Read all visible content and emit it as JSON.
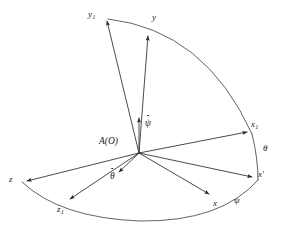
{
  "figure": {
    "type": "technical-line-diagram",
    "background_color": "#ffffff",
    "line_color": "#2b2b2b",
    "origin_label": "A(O)"
  },
  "labels": {
    "origin": "A(O)",
    "y1_base": "y",
    "y1_sub": "1",
    "y": "y",
    "psi_dot": "ψ",
    "x1_base": "x",
    "x1_sub": "1",
    "theta": "θ",
    "x_prime_base": "x",
    "x_prime_mark": "′",
    "psi": "ψ",
    "x": "x",
    "theta_dot": "θ",
    "z": "z",
    "z1_base": "z",
    "z1_sub": "1"
  },
  "axes": [
    {
      "name": "y1",
      "label": "y₁",
      "from": [
        139,
        153
      ],
      "to": [
        106,
        17
      ],
      "arrow": true
    },
    {
      "name": "y",
      "label": "y",
      "from": [
        139,
        153
      ],
      "to": [
        148,
        32
      ],
      "arrow": true
    },
    {
      "name": "psi-dot",
      "label": "ψ̇",
      "from": [
        139,
        153
      ],
      "to": [
        139,
        115
      ],
      "arrow": true
    },
    {
      "name": "x1",
      "label": "x₁",
      "from": [
        139,
        153
      ],
      "to": [
        250,
        131
      ],
      "arrow": true
    },
    {
      "name": "x-prime",
      "label": "x′",
      "from": [
        139,
        153
      ],
      "to": [
        256,
        178
      ],
      "arrow": true
    },
    {
      "name": "x",
      "label": "x",
      "from": [
        139,
        153
      ],
      "to": [
        213,
        196
      ],
      "arrow": true
    },
    {
      "name": "theta-dot",
      "label": "θ̇",
      "from": [
        139,
        153
      ],
      "to": [
        116,
        175
      ],
      "arrow": true
    },
    {
      "name": "z1",
      "label": "z₁",
      "from": [
        139,
        153
      ],
      "to": [
        66,
        202
      ],
      "arrow": true
    },
    {
      "name": "z",
      "label": "z",
      "from": [
        139,
        153
      ],
      "to": [
        22,
        181
      ],
      "arrow": true
    }
  ],
  "arcs": [
    {
      "name": "arc-y1-to-x1",
      "from": [
        106,
        17
      ],
      "to": [
        253,
        135
      ],
      "note": "passes through y"
    },
    {
      "name": "arc-x1-to-xprime",
      "from": [
        253,
        135
      ],
      "to": [
        258,
        180
      ],
      "note": "labelled theta"
    },
    {
      "name": "arc-z-to-xprime",
      "from": [
        21,
        183
      ],
      "to": [
        258,
        180
      ],
      "note": "passes through z1 and x, labelled psi"
    }
  ]
}
